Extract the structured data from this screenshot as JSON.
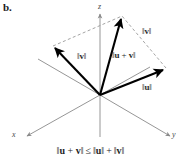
{
  "figure": {
    "panel_label": "b.",
    "axes": {
      "z_label": "z",
      "x_label": "x",
      "y_label": "y",
      "axis_color": "#8a8a8a"
    },
    "vectors": [
      {
        "name": "v",
        "label": "‖v‖",
        "origin": [
          100,
          95
        ],
        "tip": [
          53,
          46
        ],
        "color": "#000000"
      },
      {
        "name": "u+v",
        "label": "‖u + v‖",
        "origin": [
          100,
          95
        ],
        "tip": [
          122,
          16
        ],
        "color": "#000000"
      },
      {
        "name": "u",
        "label": "‖u‖",
        "origin": [
          100,
          95
        ],
        "tip": [
          166,
          68
        ],
        "color": "#000000"
      }
    ],
    "labels": {
      "v_left": {
        "open": "‖",
        "var": "v",
        "close": "‖"
      },
      "u_plus_v": {
        "open": "‖",
        "var1": "u",
        "plus": " + ",
        "var2": "v",
        "close": "‖"
      },
      "v_right": {
        "open": "‖",
        "var": "v",
        "close": "‖"
      },
      "u_right": {
        "open": "‖",
        "var": "u",
        "close": "‖"
      }
    },
    "parallelogram": {
      "style": "dashed",
      "color": "#9a9a9a",
      "points": "53,46 122,16 166,68"
    },
    "formula": {
      "lhs_open": "‖",
      "lhs_u": "u",
      "lhs_plus": " + ",
      "lhs_v": "v",
      "lhs_close": "‖",
      "relation": "≤",
      "rhs1_open": "‖",
      "rhs1_u": "u",
      "rhs1_close": "‖",
      "rhs_plus": "+",
      "rhs2_open": "‖",
      "rhs2_v": "v",
      "rhs2_close": "‖"
    }
  }
}
